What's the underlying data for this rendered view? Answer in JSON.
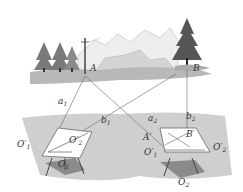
{
  "diagram": {
    "type": "plane-table-surveying-illustration",
    "colors": {
      "ground": "#c8c8c8",
      "ground_dark": "#9a9a9a",
      "tree": "#555555",
      "line": "#6a6a6a",
      "table": "#ffffff"
    },
    "labels": {
      "A": "A",
      "B": "B",
      "a1": "a",
      "a1_sub": "1",
      "b1": "b",
      "b1_sub": "1",
      "a2": "a",
      "a2_sub": "2",
      "b2": "b",
      "b2_sub": "2",
      "O1p_left": "O′",
      "O1p_left_sub": "1",
      "O2p_left": "O′",
      "O2p_left_sub": "2",
      "O1": "O",
      "O1_sub": "1",
      "A_prime": "A′",
      "B_prime": "B′",
      "O1p_right": "O′",
      "O1p_right_sub": "1",
      "O2p_right": "O′",
      "O2p_right_sub": "2",
      "O2": "O",
      "O2_sub": "2"
    }
  }
}
